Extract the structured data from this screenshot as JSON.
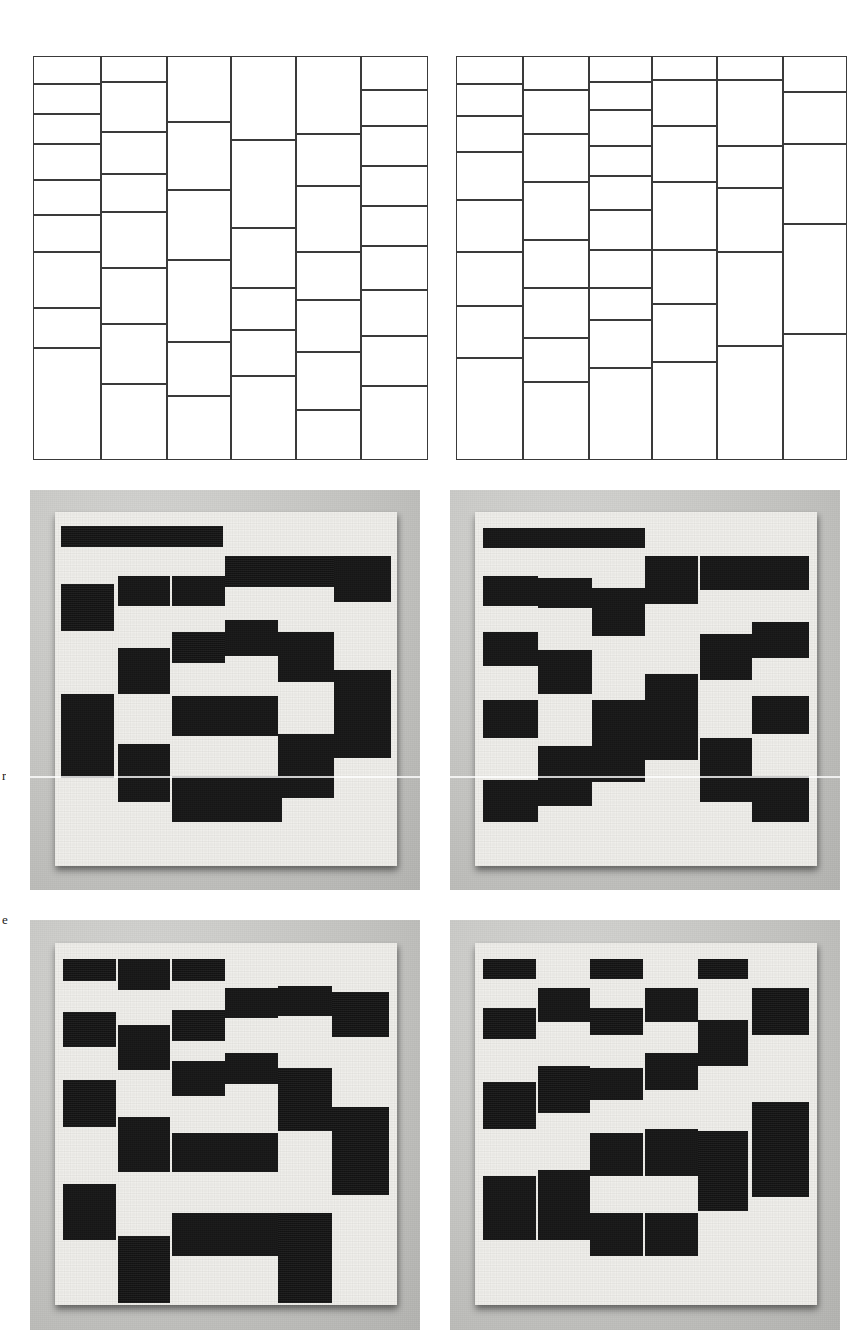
{
  "figure": {
    "page_width": 867,
    "page_height": 1342,
    "background_color": "#ffffff",
    "line_color": "#3a3a3a",
    "tile_color": "#141414",
    "board_color": "#efeeea",
    "photo_backdrop_color": "#c3c3c0",
    "margin_letters": [
      {
        "text": "r",
        "x": 2,
        "y": 768
      },
      {
        "text": "e",
        "x": 2,
        "y": 912
      }
    ]
  },
  "chart_data": [
    {
      "id": "diagram-top-left",
      "type": "table",
      "title": "",
      "description": "Six-column vertical stripe partition; each column independently subdivided into rectangles of unequal height.",
      "grid": {
        "x": 33,
        "y": 56,
        "width": 395,
        "height": 404
      },
      "column_edges": [
        33,
        101,
        167,
        231,
        296,
        361,
        428
      ],
      "columns": [
        {
          "index": 0,
          "cell_count": 9,
          "row_edges": [
            56,
            84,
            114,
            144,
            180,
            215,
            252,
            308,
            348,
            460
          ]
        },
        {
          "index": 1,
          "cell_count": 8,
          "row_edges": [
            56,
            82,
            132,
            174,
            212,
            268,
            324,
            384,
            460
          ]
        },
        {
          "index": 2,
          "cell_count": 6,
          "row_edges": [
            56,
            122,
            190,
            260,
            342,
            396,
            460
          ]
        },
        {
          "index": 3,
          "cell_count": 6,
          "row_edges": [
            56,
            140,
            228,
            288,
            330,
            376,
            460
          ]
        },
        {
          "index": 4,
          "cell_count": 7,
          "row_edges": [
            56,
            134,
            186,
            252,
            300,
            352,
            410,
            460
          ]
        },
        {
          "index": 5,
          "cell_count": 9,
          "row_edges": [
            56,
            90,
            126,
            166,
            206,
            246,
            290,
            336,
            386,
            460
          ]
        }
      ]
    },
    {
      "id": "diagram-top-right",
      "type": "table",
      "title": "",
      "description": "Second independent six-column vertical stripe partition with a different random subdivision.",
      "grid": {
        "x": 456,
        "y": 56,
        "width": 391,
        "height": 404
      },
      "column_edges": [
        456,
        523,
        589,
        652,
        717,
        783,
        847
      ],
      "columns": [
        {
          "index": 0,
          "cell_count": 8,
          "row_edges": [
            56,
            84,
            116,
            152,
            200,
            252,
            306,
            358,
            460
          ]
        },
        {
          "index": 1,
          "cell_count": 8,
          "row_edges": [
            56,
            90,
            134,
            182,
            240,
            288,
            338,
            382,
            460
          ]
        },
        {
          "index": 2,
          "cell_count": 10,
          "row_edges": [
            56,
            82,
            110,
            146,
            176,
            210,
            250,
            288,
            320,
            368,
            460
          ]
        },
        {
          "index": 3,
          "cell_count": 7,
          "row_edges": [
            56,
            80,
            126,
            182,
            250,
            304,
            362,
            460
          ]
        },
        {
          "index": 4,
          "cell_count": 6,
          "row_edges": [
            56,
            80,
            146,
            188,
            252,
            346,
            460
          ]
        },
        {
          "index": 5,
          "cell_count": 5,
          "row_edges": [
            56,
            92,
            144,
            224,
            334,
            460
          ]
        }
      ]
    },
    {
      "id": "photo-middle-left",
      "type": "heatmap",
      "title": "",
      "description": "Photograph of a white board tiled with black rectangles; black tiles are placed on a six-column vertical-stripe layout, forming a ring/spiral pattern.",
      "panel": {
        "x": 30,
        "y": 490,
        "width": 390,
        "height": 400
      },
      "tiles": [
        {
          "x": 0.08,
          "y": 0.09,
          "w": 0.135,
          "h": 0.052
        },
        {
          "x": 0.215,
          "y": 0.09,
          "w": 0.145,
          "h": 0.052
        },
        {
          "x": 0.36,
          "y": 0.09,
          "w": 0.135,
          "h": 0.052
        },
        {
          "x": 0.5,
          "y": 0.165,
          "w": 0.135,
          "h": 0.078
        },
        {
          "x": 0.635,
          "y": 0.165,
          "w": 0.145,
          "h": 0.078
        },
        {
          "x": 0.78,
          "y": 0.165,
          "w": 0.145,
          "h": 0.115
        },
        {
          "x": 0.08,
          "y": 0.235,
          "w": 0.135,
          "h": 0.118
        },
        {
          "x": 0.225,
          "y": 0.215,
          "w": 0.135,
          "h": 0.075
        },
        {
          "x": 0.365,
          "y": 0.215,
          "w": 0.135,
          "h": 0.075
        },
        {
          "x": 0.225,
          "y": 0.395,
          "w": 0.135,
          "h": 0.115
        },
        {
          "x": 0.365,
          "y": 0.355,
          "w": 0.135,
          "h": 0.078
        },
        {
          "x": 0.5,
          "y": 0.325,
          "w": 0.135,
          "h": 0.09
        },
        {
          "x": 0.635,
          "y": 0.355,
          "w": 0.145,
          "h": 0.125
        },
        {
          "x": 0.78,
          "y": 0.45,
          "w": 0.145,
          "h": 0.22
        },
        {
          "x": 0.08,
          "y": 0.51,
          "w": 0.135,
          "h": 0.21
        },
        {
          "x": 0.365,
          "y": 0.515,
          "w": 0.135,
          "h": 0.1
        },
        {
          "x": 0.5,
          "y": 0.515,
          "w": 0.135,
          "h": 0.1
        },
        {
          "x": 0.225,
          "y": 0.635,
          "w": 0.135,
          "h": 0.145
        },
        {
          "x": 0.365,
          "y": 0.715,
          "w": 0.135,
          "h": 0.115
        },
        {
          "x": 0.5,
          "y": 0.715,
          "w": 0.145,
          "h": 0.115
        },
        {
          "x": 0.635,
          "y": 0.61,
          "w": 0.145,
          "h": 0.16
        }
      ]
    },
    {
      "id": "photo-middle-right",
      "type": "heatmap",
      "title": "",
      "description": "Second photograph of the tiled board; a different random arrangement of black rectangles over the same six-column stripe structure.",
      "panel": {
        "x": 450,
        "y": 490,
        "width": 390,
        "height": 400
      },
      "tiles": [
        {
          "x": 0.085,
          "y": 0.095,
          "w": 0.14,
          "h": 0.05
        },
        {
          "x": 0.225,
          "y": 0.095,
          "w": 0.14,
          "h": 0.05
        },
        {
          "x": 0.365,
          "y": 0.095,
          "w": 0.135,
          "h": 0.05
        },
        {
          "x": 0.5,
          "y": 0.165,
          "w": 0.135,
          "h": 0.12
        },
        {
          "x": 0.64,
          "y": 0.165,
          "w": 0.135,
          "h": 0.085
        },
        {
          "x": 0.775,
          "y": 0.165,
          "w": 0.145,
          "h": 0.085
        },
        {
          "x": 0.085,
          "y": 0.215,
          "w": 0.14,
          "h": 0.075
        },
        {
          "x": 0.225,
          "y": 0.22,
          "w": 0.14,
          "h": 0.075
        },
        {
          "x": 0.365,
          "y": 0.245,
          "w": 0.135,
          "h": 0.12
        },
        {
          "x": 0.085,
          "y": 0.355,
          "w": 0.14,
          "h": 0.085
        },
        {
          "x": 0.225,
          "y": 0.4,
          "w": 0.14,
          "h": 0.11
        },
        {
          "x": 0.64,
          "y": 0.36,
          "w": 0.135,
          "h": 0.115
        },
        {
          "x": 0.775,
          "y": 0.33,
          "w": 0.145,
          "h": 0.09
        },
        {
          "x": 0.085,
          "y": 0.525,
          "w": 0.14,
          "h": 0.095
        },
        {
          "x": 0.365,
          "y": 0.525,
          "w": 0.135,
          "h": 0.205
        },
        {
          "x": 0.5,
          "y": 0.46,
          "w": 0.135,
          "h": 0.215
        },
        {
          "x": 0.775,
          "y": 0.515,
          "w": 0.145,
          "h": 0.095
        },
        {
          "x": 0.225,
          "y": 0.64,
          "w": 0.14,
          "h": 0.15
        },
        {
          "x": 0.64,
          "y": 0.62,
          "w": 0.135,
          "h": 0.16
        },
        {
          "x": 0.085,
          "y": 0.725,
          "w": 0.14,
          "h": 0.105
        },
        {
          "x": 0.775,
          "y": 0.715,
          "w": 0.145,
          "h": 0.115
        }
      ]
    },
    {
      "id": "photo-bottom-left",
      "type": "heatmap",
      "title": "",
      "description": "Third photograph of the tiled board; black rectangles span wider columns and longer vertical runs.",
      "panel": {
        "x": 30,
        "y": 920,
        "width": 390,
        "height": 410
      },
      "tiles": [
        {
          "x": 0.085,
          "y": 0.095,
          "w": 0.135,
          "h": 0.055
        },
        {
          "x": 0.225,
          "y": 0.095,
          "w": 0.135,
          "h": 0.075
        },
        {
          "x": 0.365,
          "y": 0.095,
          "w": 0.135,
          "h": 0.055
        },
        {
          "x": 0.5,
          "y": 0.165,
          "w": 0.135,
          "h": 0.075
        },
        {
          "x": 0.635,
          "y": 0.16,
          "w": 0.14,
          "h": 0.075
        },
        {
          "x": 0.775,
          "y": 0.175,
          "w": 0.145,
          "h": 0.11
        },
        {
          "x": 0.085,
          "y": 0.225,
          "w": 0.135,
          "h": 0.085
        },
        {
          "x": 0.225,
          "y": 0.255,
          "w": 0.135,
          "h": 0.11
        },
        {
          "x": 0.365,
          "y": 0.22,
          "w": 0.135,
          "h": 0.075
        },
        {
          "x": 0.365,
          "y": 0.345,
          "w": 0.135,
          "h": 0.085
        },
        {
          "x": 0.5,
          "y": 0.325,
          "w": 0.135,
          "h": 0.075
        },
        {
          "x": 0.635,
          "y": 0.36,
          "w": 0.14,
          "h": 0.155
        },
        {
          "x": 0.085,
          "y": 0.39,
          "w": 0.135,
          "h": 0.115
        },
        {
          "x": 0.775,
          "y": 0.455,
          "w": 0.145,
          "h": 0.215
        },
        {
          "x": 0.225,
          "y": 0.48,
          "w": 0.135,
          "h": 0.135
        },
        {
          "x": 0.365,
          "y": 0.52,
          "w": 0.135,
          "h": 0.095
        },
        {
          "x": 0.5,
          "y": 0.52,
          "w": 0.135,
          "h": 0.095
        },
        {
          "x": 0.085,
          "y": 0.645,
          "w": 0.135,
          "h": 0.135
        },
        {
          "x": 0.225,
          "y": 0.77,
          "w": 0.135,
          "h": 0.165
        },
        {
          "x": 0.365,
          "y": 0.715,
          "w": 0.135,
          "h": 0.105
        },
        {
          "x": 0.5,
          "y": 0.715,
          "w": 0.135,
          "h": 0.105
        },
        {
          "x": 0.635,
          "y": 0.715,
          "w": 0.14,
          "h": 0.22
        }
      ]
    },
    {
      "id": "photo-bottom-right",
      "type": "heatmap",
      "title": "",
      "description": "Fourth photograph of the tiled board; sparser arrangement with a diagonal drift of black rectangles.",
      "panel": {
        "x": 450,
        "y": 920,
        "width": 390,
        "height": 410
      },
      "tiles": [
        {
          "x": 0.085,
          "y": 0.095,
          "w": 0.135,
          "h": 0.05
        },
        {
          "x": 0.36,
          "y": 0.095,
          "w": 0.135,
          "h": 0.05
        },
        {
          "x": 0.635,
          "y": 0.095,
          "w": 0.13,
          "h": 0.05
        },
        {
          "x": 0.225,
          "y": 0.165,
          "w": 0.135,
          "h": 0.085
        },
        {
          "x": 0.5,
          "y": 0.165,
          "w": 0.135,
          "h": 0.085
        },
        {
          "x": 0.775,
          "y": 0.165,
          "w": 0.145,
          "h": 0.115
        },
        {
          "x": 0.085,
          "y": 0.215,
          "w": 0.135,
          "h": 0.075
        },
        {
          "x": 0.36,
          "y": 0.215,
          "w": 0.135,
          "h": 0.065
        },
        {
          "x": 0.635,
          "y": 0.245,
          "w": 0.13,
          "h": 0.11
        },
        {
          "x": 0.225,
          "y": 0.355,
          "w": 0.135,
          "h": 0.115
        },
        {
          "x": 0.36,
          "y": 0.36,
          "w": 0.135,
          "h": 0.08
        },
        {
          "x": 0.5,
          "y": 0.325,
          "w": 0.135,
          "h": 0.09
        },
        {
          "x": 0.085,
          "y": 0.395,
          "w": 0.135,
          "h": 0.115
        },
        {
          "x": 0.775,
          "y": 0.445,
          "w": 0.145,
          "h": 0.23
        },
        {
          "x": 0.36,
          "y": 0.52,
          "w": 0.135,
          "h": 0.105
        },
        {
          "x": 0.5,
          "y": 0.51,
          "w": 0.135,
          "h": 0.115
        },
        {
          "x": 0.635,
          "y": 0.515,
          "w": 0.13,
          "h": 0.195
        },
        {
          "x": 0.085,
          "y": 0.625,
          "w": 0.135,
          "h": 0.155
        },
        {
          "x": 0.225,
          "y": 0.61,
          "w": 0.135,
          "h": 0.17
        },
        {
          "x": 0.36,
          "y": 0.715,
          "w": 0.135,
          "h": 0.105
        },
        {
          "x": 0.5,
          "y": 0.715,
          "w": 0.135,
          "h": 0.105
        }
      ]
    }
  ]
}
